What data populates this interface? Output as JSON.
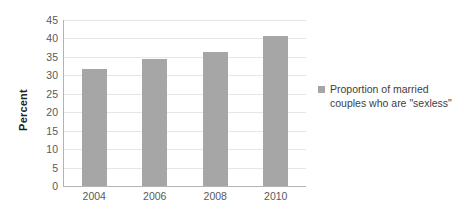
{
  "chart_data": {
    "type": "bar",
    "title": "",
    "xlabel": "",
    "ylabel": "Percent",
    "categories": [
      "2004",
      "2006",
      "2008",
      "2010"
    ],
    "values": [
      31.8,
      34.5,
      36.4,
      40.6
    ],
    "series": [
      {
        "name": "Proportion of married couples who are \"sexless\"",
        "values": [
          31.8,
          34.5,
          36.4,
          40.6
        ]
      }
    ],
    "ylim": [
      0,
      45
    ],
    "ytick_step": 5,
    "yticks": [
      "45",
      "40",
      "35",
      "30",
      "25",
      "20",
      "15",
      "10",
      "5",
      "0"
    ],
    "grid": "horizontal",
    "legend_position": "right",
    "bar_color": "#a6a6a6",
    "gridline_color": "#e6e6e6",
    "axis_color": "#b3b3b3"
  },
  "legend": {
    "entries": [
      {
        "line1": "Proportion of married",
        "line2": "couples who are \"sexless\""
      }
    ]
  }
}
